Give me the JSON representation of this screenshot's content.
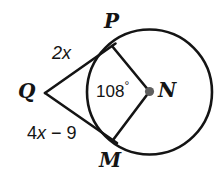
{
  "figure": {
    "background_color": "#ffffff",
    "stroke_color": "#141414",
    "center_dot_color": "#6e6e6e",
    "labels": {
      "point_p": "P",
      "point_q": "Q",
      "point_n": "N",
      "point_m": "M",
      "segment_qp": "2x",
      "segment_qm_prefix": "4",
      "segment_qm_var": "x",
      "segment_qm_suffix": " − 9",
      "angle_value": "108",
      "angle_degree_symbol": "°"
    },
    "geometry": {
      "circle": {
        "cx": 149.5,
        "cy": 92,
        "r": 62.5
      },
      "external_point": {
        "x": 45,
        "y": 93
      },
      "tangent_point_p": {
        "x": 112,
        "y": 46
      },
      "tangent_point_m": {
        "x": 113,
        "y": 140
      },
      "center_point": {
        "x": 149.5,
        "y": 91.5
      },
      "central_angle_degrees": 108
    }
  }
}
